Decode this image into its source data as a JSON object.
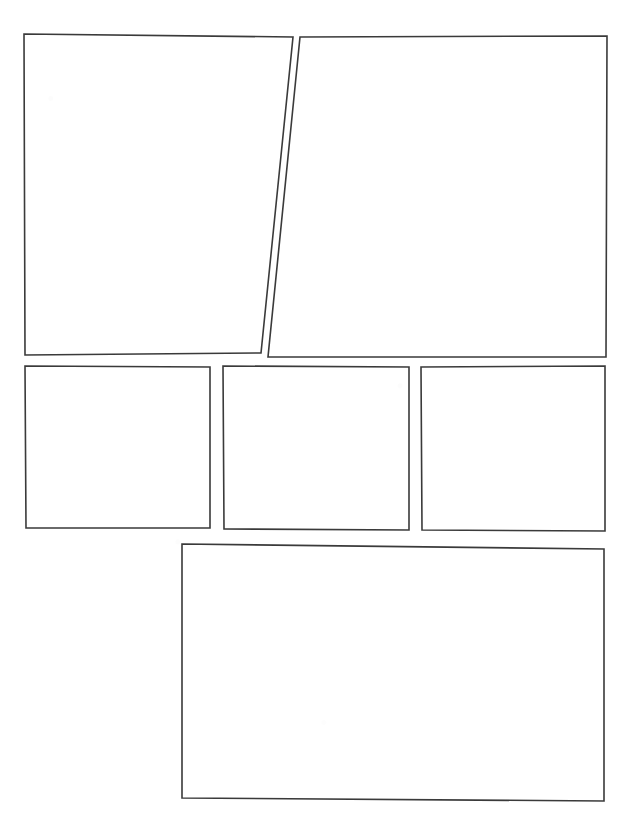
{
  "page": {
    "kind": "comic-page-template",
    "width": 635,
    "height": 821,
    "background_color": "#ffffff",
    "border_color": "#3a3a3a",
    "border_width": 1.6,
    "panel_count": 6,
    "row_count": 3
  },
  "rows": [
    {
      "name": "row-1",
      "panel_count": 2,
      "label": "Top row"
    },
    {
      "name": "row-2",
      "panel_count": 3,
      "label": "Middle row"
    },
    {
      "name": "row-3",
      "panel_count": 1,
      "label": "Bottom row"
    }
  ],
  "panels": [
    {
      "id": "panel-1",
      "row": 1,
      "index": 1,
      "shape": "quadrilateral",
      "note": "Top-left panel with right edge slanting left toward the bottom",
      "points": "24,34 293,37 261,353 25,355",
      "caption": "",
      "content": ""
    },
    {
      "id": "panel-2",
      "row": 1,
      "index": 2,
      "shape": "quadrilateral",
      "note": "Top-right panel with left edge slanting left toward the bottom",
      "points": "300,37 607,36 606,357 268,357",
      "caption": "",
      "content": ""
    },
    {
      "id": "panel-3",
      "row": 2,
      "index": 1,
      "shape": "quadrilateral",
      "note": "Middle-left panel, near rectangular",
      "points": "25,366 210,367 210,528 26,528",
      "caption": "",
      "content": ""
    },
    {
      "id": "panel-4",
      "row": 2,
      "index": 2,
      "shape": "quadrilateral",
      "note": "Middle-center panel, near rectangular",
      "points": "223,366 409,367 409,530 224,529",
      "caption": "",
      "content": ""
    },
    {
      "id": "panel-5",
      "row": 2,
      "index": 3,
      "shape": "quadrilateral",
      "note": "Middle-right panel, near rectangular",
      "points": "421,367 605,366 605,531 422,530",
      "caption": "",
      "content": ""
    },
    {
      "id": "panel-6",
      "row": 3,
      "index": 1,
      "shape": "quadrilateral",
      "note": "Wide bottom panel offset to the right",
      "points": "182,544 604,549 604,801 182,798",
      "caption": "",
      "content": ""
    }
  ]
}
